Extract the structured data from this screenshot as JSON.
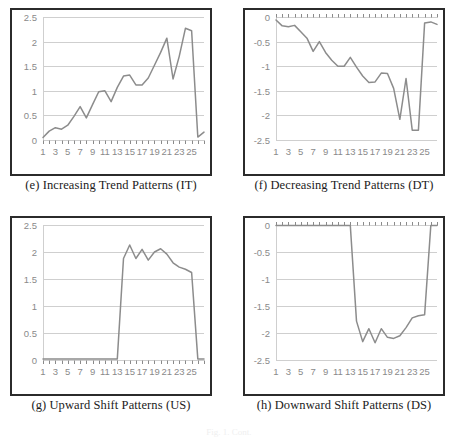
{
  "figure": {
    "note": "Fig. 1. Cont.",
    "panels": [
      {
        "id": "e",
        "caption": "(e) Increasing Trend Patterns (IT)",
        "chart_data": {
          "type": "line",
          "title": "",
          "xlabel": "",
          "ylabel": "",
          "grid": true,
          "legend": "none",
          "xlim": [
            1,
            27
          ],
          "ylim": [
            0,
            2.5
          ],
          "yticks": [
            "0",
            "0.5",
            "1",
            "1.5",
            "2",
            "2.5"
          ],
          "ytick_values": [
            0,
            0.5,
            1,
            1.5,
            2,
            2.5
          ],
          "xticks": [
            "1",
            "3",
            "5",
            "7",
            "9",
            "11",
            "13",
            "15",
            "17",
            "19",
            "21",
            "23",
            "25"
          ],
          "xtick_values": [
            1,
            3,
            5,
            7,
            9,
            11,
            13,
            15,
            17,
            19,
            21,
            23,
            25
          ],
          "x": [
            1,
            2,
            3,
            4,
            5,
            6,
            7,
            8,
            9,
            10,
            11,
            12,
            13,
            14,
            15,
            16,
            17,
            18,
            19,
            20,
            21,
            22,
            23,
            24,
            25,
            26,
            27
          ],
          "values": [
            0.05,
            0.18,
            0.25,
            0.22,
            0.3,
            0.48,
            0.68,
            0.45,
            0.72,
            0.98,
            1.0,
            0.78,
            1.07,
            1.3,
            1.32,
            1.12,
            1.12,
            1.26,
            1.52,
            1.78,
            2.07,
            1.24,
            1.7,
            2.27,
            2.22,
            0.06,
            0.16
          ],
          "series_color": "#8c8c8c"
        }
      },
      {
        "id": "f",
        "caption": "(f) Decreasing Trend Patterns (DT)",
        "chart_data": {
          "type": "line",
          "title": "",
          "xlabel": "",
          "ylabel": "",
          "grid": true,
          "legend": "none",
          "xlim": [
            1,
            27
          ],
          "ylim": [
            -2.5,
            0
          ],
          "yticks": [
            "0",
            "-0.5",
            "-1",
            "-1.5",
            "-2",
            "-2.5"
          ],
          "ytick_values": [
            0,
            -0.5,
            -1,
            -1.5,
            -2,
            -2.5
          ],
          "xticks": [
            "1",
            "3",
            "5",
            "7",
            "9",
            "11",
            "13",
            "15",
            "17",
            "19",
            "21",
            "23",
            "25"
          ],
          "xtick_values": [
            1,
            3,
            5,
            7,
            9,
            11,
            13,
            15,
            17,
            19,
            21,
            23,
            25
          ],
          "x": [
            1,
            2,
            3,
            4,
            5,
            6,
            7,
            8,
            9,
            10,
            11,
            12,
            13,
            14,
            15,
            16,
            17,
            18,
            19,
            20,
            21,
            22,
            23,
            24,
            25,
            26,
            27
          ],
          "values": [
            -0.06,
            -0.18,
            -0.2,
            -0.17,
            -0.3,
            -0.43,
            -0.7,
            -0.5,
            -0.72,
            -0.88,
            -1.0,
            -1.0,
            -0.82,
            -1.02,
            -1.2,
            -1.33,
            -1.32,
            -1.14,
            -1.15,
            -1.45,
            -2.08,
            -1.25,
            -2.3,
            -2.3,
            -0.12,
            -0.1,
            -0.15
          ],
          "series_color": "#8c8c8c"
        }
      },
      {
        "id": "g",
        "caption": "(g) Upward Shift Patterns (US)",
        "chart_data": {
          "type": "line",
          "title": "",
          "xlabel": "",
          "ylabel": "",
          "grid": true,
          "legend": "none",
          "xlim": [
            1,
            27
          ],
          "ylim": [
            0,
            2.5
          ],
          "yticks": [
            "0",
            "0.5",
            "1",
            "1.5",
            "2",
            "2.5"
          ],
          "ytick_values": [
            0,
            0.5,
            1,
            1.5,
            2,
            2.5
          ],
          "xticks": [
            "1",
            "3",
            "5",
            "7",
            "9",
            "11",
            "13",
            "15",
            "17",
            "19",
            "21",
            "23",
            "25"
          ],
          "xtick_values": [
            1,
            3,
            5,
            7,
            9,
            11,
            13,
            15,
            17,
            19,
            21,
            23,
            25
          ],
          "x": [
            1,
            2,
            3,
            4,
            5,
            6,
            7,
            8,
            9,
            10,
            11,
            12,
            13,
            14,
            15,
            16,
            17,
            18,
            19,
            20,
            21,
            22,
            23,
            24,
            25,
            26,
            27
          ],
          "values": [
            0.02,
            0.02,
            0.02,
            0.02,
            0.02,
            0.02,
            0.02,
            0.02,
            0.02,
            0.02,
            0.02,
            0.02,
            0.02,
            1.88,
            2.13,
            1.88,
            2.05,
            1.85,
            2.0,
            2.06,
            1.96,
            1.8,
            1.72,
            1.68,
            1.62,
            0.02,
            0.02
          ],
          "series_color": "#8c8c8c"
        }
      },
      {
        "id": "h",
        "caption": "(h) Downward Shift Patterns (DS)",
        "chart_data": {
          "type": "line",
          "title": "",
          "xlabel": "",
          "ylabel": "",
          "grid": true,
          "legend": "none",
          "xlim": [
            1,
            27
          ],
          "ylim": [
            -2.5,
            0
          ],
          "yticks": [
            "0",
            "-0.5",
            "-1",
            "-1.5",
            "-2",
            "-2.5"
          ],
          "ytick_values": [
            0,
            -0.5,
            -1,
            -1.5,
            -2,
            -2.5
          ],
          "xticks": [
            "1",
            "3",
            "5",
            "7",
            "9",
            "11",
            "13",
            "15",
            "17",
            "19",
            "21",
            "23",
            "25"
          ],
          "xtick_values": [
            1,
            3,
            5,
            7,
            9,
            11,
            13,
            15,
            17,
            19,
            21,
            23,
            25
          ],
          "x": [
            1,
            2,
            3,
            4,
            5,
            6,
            7,
            8,
            9,
            10,
            11,
            12,
            13,
            14,
            15,
            16,
            17,
            18,
            19,
            20,
            21,
            22,
            23,
            24,
            25,
            26,
            27
          ],
          "values": [
            -0.01,
            -0.01,
            -0.01,
            -0.01,
            -0.01,
            -0.01,
            -0.01,
            -0.01,
            -0.01,
            -0.01,
            -0.01,
            -0.01,
            -0.01,
            -1.78,
            -2.16,
            -1.92,
            -2.18,
            -1.92,
            -2.08,
            -2.1,
            -2.05,
            -1.9,
            -1.72,
            -1.68,
            -1.66,
            -0.01,
            -0.01
          ],
          "series_color": "#8c8c8c"
        }
      }
    ]
  },
  "style": {
    "axis_text_color": "#8a8a8a",
    "grid_color": "#cfcfcf",
    "border_color": "#2b2b2b",
    "line_color": "#8c8c8c"
  }
}
